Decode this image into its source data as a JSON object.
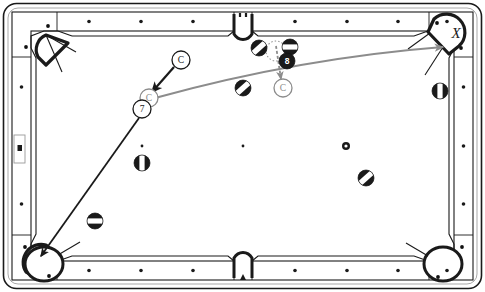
{
  "diagram": {
    "type": "billiards-position-diagram",
    "table": {
      "name": "pool-table",
      "outer_frame_color": "#ffffff",
      "rail_color": "#ffffff",
      "cloth_color": "#ffffff",
      "line_color": "#1a1a1a",
      "pockets": [
        {
          "name": "pocket-top-left",
          "kind": "corner",
          "x": 40,
          "y": 38
        },
        {
          "name": "pocket-top-middle",
          "kind": "side",
          "x": 243,
          "y": 30
        },
        {
          "name": "pocket-top-right",
          "kind": "corner",
          "x": 452,
          "y": 38,
          "label": "X"
        },
        {
          "name": "pocket-bottom-left",
          "kind": "corner",
          "x": 40,
          "y": 258,
          "label": ""
        },
        {
          "name": "pocket-bottom-middle",
          "kind": "side",
          "x": 243,
          "y": 264
        },
        {
          "name": "pocket-bottom-right",
          "kind": "corner",
          "x": 452,
          "y": 258
        }
      ],
      "diamonds_top": [
        89,
        141,
        193,
        295,
        347,
        398,
        447
      ],
      "diamonds_bottom": [
        89,
        141,
        193,
        295,
        347,
        398,
        447
      ],
      "diamonds_left": [
        87,
        146,
        204
      ],
      "diamonds_right": [
        87,
        146,
        204
      ],
      "spots": [
        {
          "name": "table-spot-left",
          "x": 142,
          "y": 146
        },
        {
          "name": "table-spot-center",
          "x": 243,
          "y": 146
        },
        {
          "name": "table-spot-right",
          "x": 346,
          "y": 146
        }
      ],
      "rail_marker": {
        "name": "left-rail-marker",
        "x": 14,
        "y": 135,
        "w": 11,
        "h": 28
      }
    },
    "balls": [
      {
        "name": "ball-striped-a",
        "label": "",
        "x": 259,
        "y": 48,
        "r": 8,
        "style": "striped-diagonal"
      },
      {
        "name": "ball-striped-b",
        "label": "",
        "x": 290,
        "y": 47,
        "r": 8,
        "style": "striped-horizontal"
      },
      {
        "name": "ball-eight",
        "label": "8",
        "x": 287,
        "y": 61,
        "r": 8,
        "style": "solid-black"
      },
      {
        "name": "ball-striped-c",
        "label": "",
        "x": 243,
        "y": 88,
        "r": 8,
        "style": "striped-diagonal"
      },
      {
        "name": "ball-striped-d",
        "label": "",
        "x": 440,
        "y": 91,
        "r": 8,
        "style": "striped-vertical"
      },
      {
        "name": "ball-striped-e",
        "label": "",
        "x": 142,
        "y": 163,
        "r": 8,
        "style": "striped-vertical"
      },
      {
        "name": "ball-striped-f",
        "label": "",
        "x": 366,
        "y": 178,
        "r": 8,
        "style": "striped-diagonal"
      },
      {
        "name": "ball-striped-g",
        "label": "",
        "x": 95,
        "y": 221,
        "r": 8,
        "style": "striped-horizontal"
      },
      {
        "name": "ball-small-marker",
        "label": "",
        "x": 346,
        "y": 146,
        "r": 4,
        "style": "small-ring"
      }
    ],
    "labeled_markers": [
      {
        "name": "cue-ball-start-label",
        "label": "C",
        "x": 181,
        "y": 60,
        "r": 9,
        "color": "#1a1a1a",
        "fill": "#ffffff"
      },
      {
        "name": "cue-ball-contact-ghost",
        "label": "C",
        "x": 149,
        "y": 98,
        "r": 9,
        "color": "#8c8c8c",
        "fill": "#ffffff"
      },
      {
        "name": "object-ball-seven",
        "label": "7",
        "x": 142,
        "y": 109,
        "r": 9,
        "color": "#1a1a1a",
        "fill": "#ffffff"
      },
      {
        "name": "cue-ball-after-label",
        "label": "C",
        "x": 283,
        "y": 88,
        "r": 9,
        "color": "#8c8c8c",
        "fill": "#ffffff"
      },
      {
        "name": "pocket-target-x",
        "label": "X",
        "x": 456,
        "y": 31,
        "r": 0,
        "color": "#1a1a1a",
        "fill": "none"
      }
    ],
    "paths": [
      {
        "name": "cue-approach-arrow",
        "kind": "arrow-straight",
        "color": "#1a1a1a",
        "from": {
          "x": 174,
          "y": 67
        },
        "to": {
          "x": 152,
          "y": 92
        },
        "width": 2.2
      },
      {
        "name": "object-ball-seven-to-corner-arrow",
        "kind": "arrow-straight",
        "color": "#1a1a1a",
        "from": {
          "x": 139,
          "y": 118
        },
        "to": {
          "x": 41,
          "y": 256
        },
        "width": 1.8
      },
      {
        "name": "cue-ball-travel-path",
        "kind": "arrow-curved",
        "color": "#8c8c8c",
        "from": {
          "x": 155,
          "y": 98
        },
        "via": {
          "x": 300,
          "y": 58
        },
        "to": {
          "x": 443,
          "y": 47
        },
        "width": 2.0
      },
      {
        "name": "cue-ball-deflection-arrow",
        "kind": "arrow-straight-dashed-head",
        "color": "#8c8c8c",
        "from": {
          "x": 276,
          "y": 46
        },
        "to": {
          "x": 281,
          "y": 79
        },
        "width": 1.8
      }
    ],
    "ghost_outline": {
      "name": "ghost-ball-dotted-circle",
      "x": 276,
      "y": 51,
      "r": 10,
      "color": "#9a9a9a",
      "dash": "1.5 2"
    }
  },
  "legend": {
    "cue_ball_letter": "C",
    "target_pocket_letter": "X",
    "object_ball_number": "7",
    "eight_ball_number": "8"
  }
}
